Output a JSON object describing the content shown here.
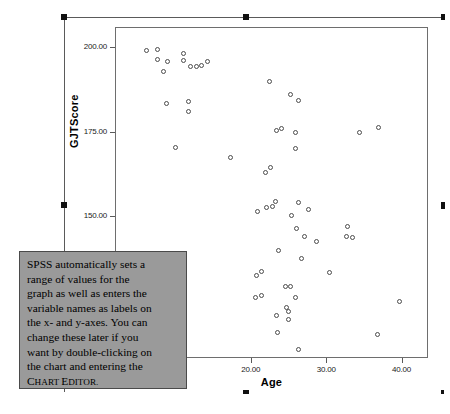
{
  "chart_data": {
    "type": "scatter",
    "title": "",
    "xlabel": "Age",
    "ylabel": "GJTScore",
    "xlim": [
      2.0,
      43.5
    ],
    "ylim": [
      108.0,
      206.0
    ],
    "xticks": [
      "10.00",
      "20.00",
      "30.00",
      "40.00"
    ],
    "xtick_values": [
      10,
      20,
      30,
      40
    ],
    "yticks": [
      "200.00",
      "175.00",
      "150.00",
      "125.00"
    ],
    "ytick_values": [
      200,
      175,
      150,
      125
    ],
    "grid": false,
    "legend": "none",
    "marker": "open-circle",
    "series": [
      {
        "name": "GJTScore by Age",
        "points": [
          [
            6.1,
            199.2
          ],
          [
            7.6,
            199.4
          ],
          [
            7.6,
            196.6
          ],
          [
            8.3,
            193.0
          ],
          [
            8.9,
            196.0
          ],
          [
            11.0,
            198.4
          ],
          [
            11.0,
            196.2
          ],
          [
            11.9,
            194.6
          ],
          [
            12.7,
            194.6
          ],
          [
            13.4,
            194.8
          ],
          [
            14.2,
            196.0
          ],
          [
            8.8,
            183.6
          ],
          [
            11.7,
            184.2
          ],
          [
            11.7,
            181.2
          ],
          [
            9.9,
            170.6
          ],
          [
            17.2,
            167.6
          ],
          [
            22.4,
            190.0
          ],
          [
            25.2,
            186.2
          ],
          [
            26.3,
            184.4
          ],
          [
            23.4,
            175.4
          ],
          [
            24.0,
            176.2
          ],
          [
            25.9,
            174.8
          ],
          [
            34.4,
            175.0
          ],
          [
            36.9,
            176.4
          ],
          [
            25.9,
            170.2
          ],
          [
            21.9,
            163.2
          ],
          [
            22.6,
            164.6
          ],
          [
            20.8,
            151.6
          ],
          [
            22.0,
            152.8
          ],
          [
            22.8,
            153.0
          ],
          [
            23.2,
            154.4
          ],
          [
            26.2,
            154.2
          ],
          [
            27.6,
            152.2
          ],
          [
            25.3,
            150.4
          ],
          [
            26.0,
            146.6
          ],
          [
            27.0,
            144.2
          ],
          [
            28.7,
            142.6
          ],
          [
            32.7,
            147.0
          ],
          [
            32.6,
            144.0
          ],
          [
            33.4,
            143.8
          ],
          [
            23.6,
            140.0
          ],
          [
            26.6,
            137.6
          ],
          [
            30.4,
            133.4
          ],
          [
            20.7,
            132.6
          ],
          [
            21.4,
            133.8
          ],
          [
            20.6,
            126.0
          ],
          [
            21.4,
            126.6
          ],
          [
            24.6,
            129.4
          ],
          [
            25.2,
            129.4
          ],
          [
            25.8,
            126.0
          ],
          [
            24.7,
            123.2
          ],
          [
            25.0,
            122.0
          ],
          [
            24.9,
            119.6
          ],
          [
            23.4,
            120.8
          ],
          [
            23.5,
            115.6
          ],
          [
            39.6,
            125.0
          ],
          [
            36.7,
            115.0
          ],
          [
            26.2,
            110.6
          ]
        ]
      }
    ]
  },
  "callout": {
    "text_lines": [
      "SPSS automatically sets a",
      "range of values for the",
      "graph as well as enters the",
      "variable names as labels on",
      "the x- and y-axes. You can",
      "change these later if you",
      "want by double-clicking on",
      "the chart and entering the"
    ],
    "final_term_first": "C",
    "final_term_rest_1": "HART ",
    "final_term_cap_2": "E",
    "final_term_rest_2": "DITOR."
  },
  "selection": {
    "handle_label": "resize-handle"
  }
}
